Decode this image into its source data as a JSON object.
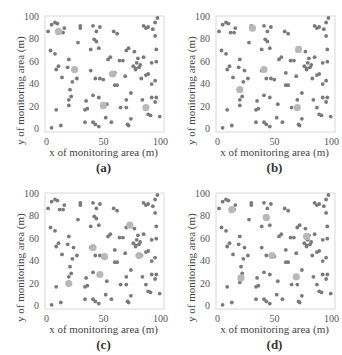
{
  "chart_data": [
    {
      "type": "scatter",
      "panel_label": "(a)",
      "xlabel": "x of monitoring area (m)",
      "ylabel": "y of monitoring area (m)",
      "xlim": [
        0,
        100
      ],
      "ylim": [
        0,
        100
      ],
      "xticks": [
        0,
        50,
        100
      ],
      "yticks": [
        0,
        20,
        40,
        60,
        80,
        100
      ],
      "series": [
        {
          "name": "sensor nodes",
          "color": "#7a7a7a",
          "points": "nodes"
        },
        {
          "name": "cluster heads",
          "color": "#b8b8b8",
          "points": [
            [
              10,
              88
            ],
            [
              24,
              54
            ],
            [
              57,
              50
            ],
            [
              49,
              22
            ],
            [
              86,
              20
            ]
          ]
        }
      ]
    },
    {
      "type": "scatter",
      "panel_label": "(b)",
      "xlabel": "x of monitoring area (m)",
      "ylabel": "y of monitoring area (m)",
      "xlim": [
        0,
        100
      ],
      "ylim": [
        0,
        100
      ],
      "xticks": [
        0,
        50,
        100
      ],
      "yticks": [
        0,
        20,
        40,
        60,
        80,
        100
      ],
      "series": [
        {
          "name": "sensor nodes",
          "color": "#7a7a7a",
          "points": "nodes"
        },
        {
          "name": "cluster heads",
          "color": "#b8b8b8",
          "points": [
            [
              30,
              91
            ],
            [
              70,
              72
            ],
            [
              40,
              54
            ],
            [
              19,
              36
            ],
            [
              69,
              20
            ]
          ]
        }
      ]
    },
    {
      "type": "scatter",
      "panel_label": "(c)",
      "xlabel": "x of monitoring area (m)",
      "ylabel": "y of monitoring area (m)",
      "xlim": [
        0,
        100
      ],
      "ylim": [
        0,
        100
      ],
      "xticks": [
        0,
        50,
        100
      ],
      "yticks": [
        0,
        20,
        40,
        60,
        80,
        100
      ],
      "series": [
        {
          "name": "sensor nodes",
          "color": "#7a7a7a",
          "points": "nodes"
        },
        {
          "name": "cluster heads",
          "color": "#b8b8b8",
          "points": [
            [
              72,
              73
            ],
            [
              40,
              53
            ],
            [
              50,
              45
            ],
            [
              80,
              46
            ],
            [
              46,
              29
            ],
            [
              19,
              21
            ]
          ]
        }
      ]
    },
    {
      "type": "scatter",
      "panel_label": "(d)",
      "xlabel": "x of monitoring area (m)",
      "ylabel": "y of monitoring area (m)",
      "xlim": [
        0,
        100
      ],
      "ylim": [
        0,
        100
      ],
      "xticks": [
        0,
        50,
        100
      ],
      "yticks": [
        0,
        20,
        40,
        60,
        80,
        100
      ],
      "series": [
        {
          "name": "sensor nodes",
          "color": "#7a7a7a",
          "points": "nodes"
        },
        {
          "name": "cluster heads",
          "color": "#b8b8b8",
          "points": [
            [
              12,
              87
            ],
            [
              42,
              80
            ],
            [
              77,
              63
            ],
            [
              47,
              46
            ],
            [
              68,
              27
            ],
            [
              20,
              26
            ]
          ]
        }
      ]
    }
  ],
  "nodes": [
    [
      1,
      88
    ],
    [
      4,
      94
    ],
    [
      7,
      96
    ],
    [
      9,
      95
    ],
    [
      11,
      87
    ],
    [
      14,
      87
    ],
    [
      15,
      91
    ],
    [
      29,
      91
    ],
    [
      29,
      93
    ],
    [
      40,
      93
    ],
    [
      43,
      88
    ],
    [
      46,
      92
    ],
    [
      58,
      88
    ],
    [
      61,
      86
    ],
    [
      84,
      93
    ],
    [
      86,
      91
    ],
    [
      88,
      92
    ],
    [
      92,
      90
    ],
    [
      94,
      96
    ],
    [
      96,
      100
    ],
    [
      94,
      84
    ],
    [
      3,
      71
    ],
    [
      7,
      68
    ],
    [
      27,
      78
    ],
    [
      38,
      72
    ],
    [
      41,
      81
    ],
    [
      43,
      79
    ],
    [
      45,
      73
    ],
    [
      69,
      71
    ],
    [
      71,
      73
    ],
    [
      76,
      70
    ],
    [
      79,
      64
    ],
    [
      81,
      58
    ],
    [
      84,
      65
    ],
    [
      91,
      60
    ],
    [
      95,
      61
    ],
    [
      95,
      72
    ],
    [
      8,
      54
    ],
    [
      10,
      57
    ],
    [
      13,
      47
    ],
    [
      18,
      56
    ],
    [
      19,
      63
    ],
    [
      23,
      53
    ],
    [
      26,
      46
    ],
    [
      38,
      53
    ],
    [
      42,
      46
    ],
    [
      46,
      46
    ],
    [
      49,
      45
    ],
    [
      53,
      63
    ],
    [
      55,
      65
    ],
    [
      59,
      51
    ],
    [
      63,
      62
    ],
    [
      68,
      48
    ],
    [
      75,
      57
    ],
    [
      77,
      54
    ],
    [
      78,
      60
    ],
    [
      80,
      56
    ],
    [
      82,
      46
    ],
    [
      86,
      49
    ],
    [
      88,
      50
    ],
    [
      91,
      41
    ],
    [
      94,
      44
    ],
    [
      20,
      36
    ],
    [
      22,
      43
    ],
    [
      19,
      27
    ],
    [
      21,
      30
    ],
    [
      19,
      22
    ],
    [
      8,
      18
    ],
    [
      34,
      26
    ],
    [
      33,
      18
    ],
    [
      35,
      19
    ],
    [
      40,
      31
    ],
    [
      45,
      29
    ],
    [
      52,
      23
    ],
    [
      59,
      40
    ],
    [
      64,
      20
    ],
    [
      69,
      27
    ],
    [
      69,
      20
    ],
    [
      73,
      10
    ],
    [
      77,
      55
    ],
    [
      83,
      27
    ],
    [
      86,
      20
    ],
    [
      88,
      14
    ],
    [
      90,
      13
    ],
    [
      91,
      29
    ],
    [
      94,
      25
    ],
    [
      95,
      29
    ],
    [
      98,
      12
    ],
    [
      4,
      2
    ],
    [
      12,
      4
    ],
    [
      33,
      7
    ],
    [
      40,
      7
    ],
    [
      42,
      5
    ],
    [
      45,
      3
    ],
    [
      51,
      11
    ],
    [
      56,
      7
    ],
    [
      70,
      5
    ],
    [
      71,
      4
    ],
    [
      61,
      40
    ],
    [
      73,
      33
    ],
    [
      66,
      62
    ]
  ]
}
